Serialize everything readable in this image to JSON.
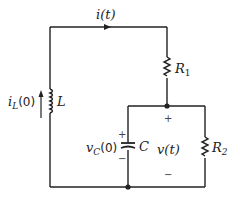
{
  "diagram": {
    "type": "circuit",
    "components": {
      "inductor": {
        "symbol": "L",
        "current_label": "i",
        "current_sub": "L",
        "current_arg": "(0)"
      },
      "resistor1": {
        "symbol": "R",
        "sub": "1"
      },
      "resistor2": {
        "symbol": "R",
        "sub": "2"
      },
      "capacitor": {
        "symbol": "C",
        "voltage_label": "v",
        "voltage_sub": "C",
        "voltage_arg": "(0)"
      }
    },
    "loop_current": "i(t)",
    "output_voltage": "v(t)",
    "signs": {
      "plus": "+",
      "minus": "−"
    },
    "colors": {
      "wire": "#222222",
      "background": "#ffffff"
    }
  }
}
